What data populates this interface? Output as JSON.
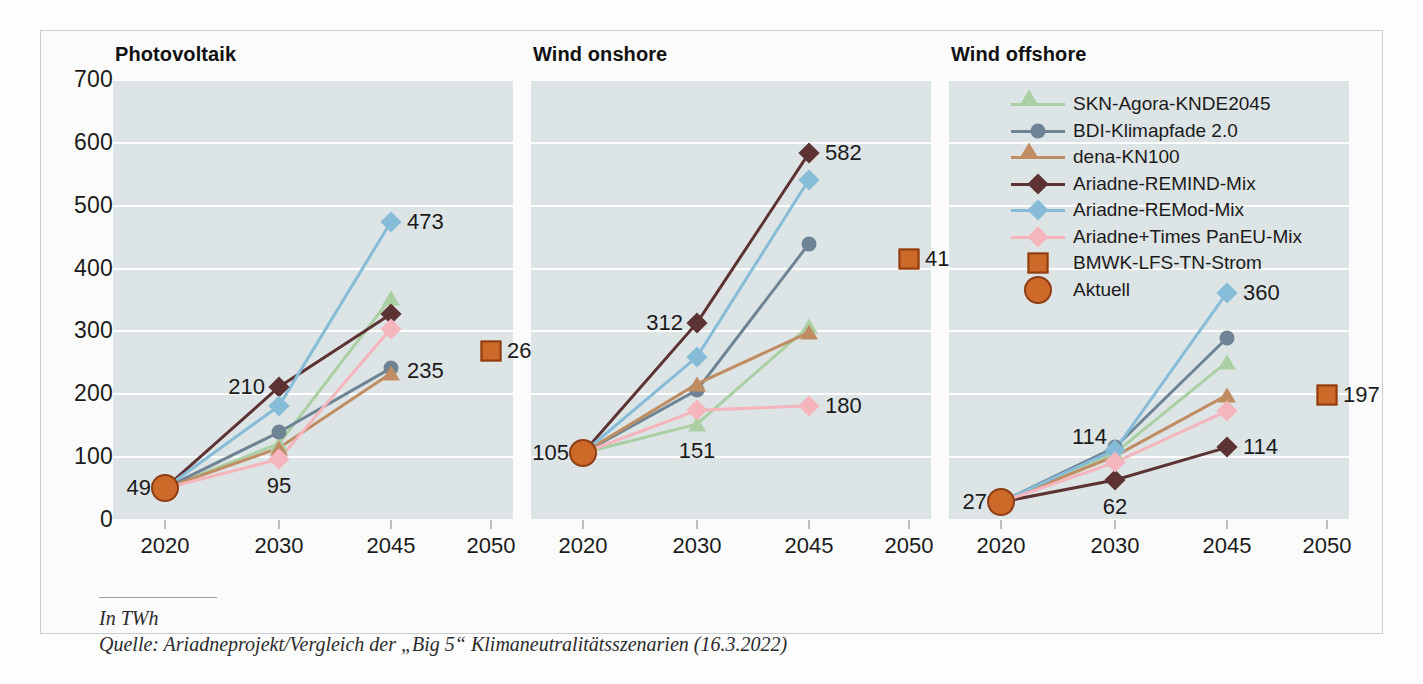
{
  "footer": {
    "unit": "In TWh",
    "source": "Quelle: Ariadneprojekt/Vergleich der „Big 5“ Klimaneutralitätsszenarien (16.3.2022)"
  },
  "legend": {
    "items": [
      {
        "label": "SKN-Agora-KNDE2045",
        "color": "#a9cfa3",
        "marker": "triangle",
        "line": true
      },
      {
        "label": "BDI-Klimapfade 2.0",
        "color": "#6e8494",
        "marker": "circle",
        "line": true
      },
      {
        "label": "dena-KN100",
        "color": "#c08d63",
        "marker": "triangle",
        "line": true
      },
      {
        "label": "Ariadne-REMIND-Mix",
        "color": "#5c3233",
        "marker": "diamond",
        "line": true
      },
      {
        "label": "Ariadne-REMod-Mix",
        "color": "#86bcd8",
        "marker": "diamond",
        "line": true
      },
      {
        "label": "Ariadne+Times PanEU-Mix",
        "color": "#f5b5bd",
        "marker": "diamond",
        "line": true
      },
      {
        "label": "BMWK-LFS-TN-Strom",
        "color": "#cd6a2a",
        "marker": "square",
        "line": false
      },
      {
        "label": "Aktuell",
        "color": "#cd6a2a",
        "marker": "bigcircle",
        "line": false
      }
    ]
  },
  "chart_data": [
    {
      "type": "line",
      "title": "Photovoltaik",
      "xlabel": "",
      "ylabel": "In TWh",
      "x": [
        2020,
        2030,
        2045,
        2050
      ],
      "xtick_labels": [
        "2020",
        "2030",
        "2045",
        "2050"
      ],
      "ylim": [
        0,
        700
      ],
      "yticks": [
        0,
        100,
        200,
        300,
        400,
        500,
        600,
        700
      ],
      "grid": true,
      "legend_position": "right",
      "series": [
        {
          "name": "SKN-Agora-KNDE2045",
          "x": [
            2020,
            2030,
            2045
          ],
          "values": [
            49,
            120,
            352
          ]
        },
        {
          "name": "BDI-Klimapfade 2.0",
          "x": [
            2020,
            2030,
            2045
          ],
          "values": [
            49,
            138,
            240
          ]
        },
        {
          "name": "dena-KN100",
          "x": [
            2020,
            2030,
            2045
          ],
          "values": [
            49,
            113,
            232
          ]
        },
        {
          "name": "Ariadne-REMIND-Mix",
          "x": [
            2020,
            2030,
            2045
          ],
          "values": [
            49,
            210,
            326
          ]
        },
        {
          "name": "Ariadne-REMod-Mix",
          "x": [
            2020,
            2030,
            2045
          ],
          "values": [
            49,
            180,
            473
          ]
        },
        {
          "name": "Ariadne+Times PanEU-Mix",
          "x": [
            2020,
            2030,
            2045
          ],
          "values": [
            49,
            95,
            303
          ]
        },
        {
          "name": "BMWK-LFS-TN-Strom",
          "x": [
            2050
          ],
          "values": [
            268
          ]
        },
        {
          "name": "Aktuell",
          "x": [
            2020
          ],
          "values": [
            49
          ]
        }
      ],
      "annotations": [
        {
          "text": "49",
          "x": 2020,
          "y": 49,
          "place": "left"
        },
        {
          "text": "210",
          "x": 2030,
          "y": 210,
          "place": "left"
        },
        {
          "text": "95",
          "x": 2030,
          "y": 95,
          "place": "below"
        },
        {
          "text": "473",
          "x": 2045,
          "y": 473,
          "place": "right"
        },
        {
          "text": "235",
          "x": 2045,
          "y": 236,
          "place": "right"
        },
        {
          "text": "268",
          "x": 2050,
          "y": 268,
          "place": "right"
        }
      ]
    },
    {
      "type": "line",
      "title": "Wind onshore",
      "xlabel": "",
      "ylabel": "In TWh",
      "x": [
        2020,
        2030,
        2045,
        2050
      ],
      "xtick_labels": [
        "2020",
        "2030",
        "2045",
        "2050"
      ],
      "ylim": [
        0,
        700
      ],
      "yticks": [
        0,
        100,
        200,
        300,
        400,
        500,
        600,
        700
      ],
      "grid": true,
      "legend_position": "right",
      "series": [
        {
          "name": "SKN-Agora-KNDE2045",
          "x": [
            2020,
            2030,
            2045
          ],
          "values": [
            105,
            151,
            307
          ]
        },
        {
          "name": "BDI-Klimapfade 2.0",
          "x": [
            2020,
            2030,
            2045
          ],
          "values": [
            105,
            205,
            438
          ]
        },
        {
          "name": "dena-KN100",
          "x": [
            2020,
            2030,
            2045
          ],
          "values": [
            105,
            215,
            297
          ]
        },
        {
          "name": "Ariadne-REMIND-Mix",
          "x": [
            2020,
            2030,
            2045
          ],
          "values": [
            105,
            312,
            582
          ]
        },
        {
          "name": "Ariadne-REMod-Mix",
          "x": [
            2020,
            2030,
            2045
          ],
          "values": [
            105,
            258,
            540
          ]
        },
        {
          "name": "Ariadne+Times PanEU-Mix",
          "x": [
            2020,
            2030,
            2045
          ],
          "values": [
            105,
            173,
            180
          ]
        },
        {
          "name": "BMWK-LFS-TN-Strom",
          "x": [
            2050
          ],
          "values": [
            413
          ]
        },
        {
          "name": "Aktuell",
          "x": [
            2020
          ],
          "values": [
            105
          ]
        }
      ],
      "annotations": [
        {
          "text": "105",
          "x": 2020,
          "y": 105,
          "place": "left"
        },
        {
          "text": "312",
          "x": 2030,
          "y": 312,
          "place": "left"
        },
        {
          "text": "151",
          "x": 2030,
          "y": 151,
          "place": "below"
        },
        {
          "text": "582",
          "x": 2045,
          "y": 582,
          "place": "right"
        },
        {
          "text": "180",
          "x": 2045,
          "y": 180,
          "place": "right"
        },
        {
          "text": "413",
          "x": 2050,
          "y": 413,
          "place": "right"
        }
      ]
    },
    {
      "type": "line",
      "title": "Wind offshore",
      "xlabel": "",
      "ylabel": "In TWh",
      "x": [
        2020,
        2030,
        2045,
        2050
      ],
      "xtick_labels": [
        "2020",
        "2030",
        "2045",
        "2050"
      ],
      "ylim": [
        0,
        700
      ],
      "yticks": [
        0,
        100,
        200,
        300,
        400,
        500,
        600,
        700
      ],
      "grid": true,
      "legend_position": "right",
      "series": [
        {
          "name": "SKN-Agora-KNDE2045",
          "x": [
            2020,
            2030,
            2045
          ],
          "values": [
            27,
            105,
            250
          ]
        },
        {
          "name": "BDI-Klimapfade 2.0",
          "x": [
            2020,
            2030,
            2045
          ],
          "values": [
            27,
            114,
            288
          ]
        },
        {
          "name": "dena-KN100",
          "x": [
            2020,
            2030,
            2045
          ],
          "values": [
            27,
            100,
            197
          ]
        },
        {
          "name": "Ariadne-REMIND-Mix",
          "x": [
            2020,
            2030,
            2045
          ],
          "values": [
            27,
            62,
            114
          ]
        },
        {
          "name": "Ariadne-REMod-Mix",
          "x": [
            2020,
            2030,
            2045
          ],
          "values": [
            27,
            110,
            360
          ]
        },
        {
          "name": "Ariadne+Times PanEU-Mix",
          "x": [
            2020,
            2030,
            2045
          ],
          "values": [
            27,
            90,
            172
          ]
        },
        {
          "name": "BMWK-LFS-TN-Strom",
          "x": [
            2050
          ],
          "values": [
            197
          ]
        },
        {
          "name": "Aktuell",
          "x": [
            2020
          ],
          "values": [
            27
          ]
        }
      ],
      "annotations": [
        {
          "text": "27",
          "x": 2020,
          "y": 27,
          "place": "left"
        },
        {
          "text": "114",
          "x": 2030,
          "y": 130,
          "place": "leftnear"
        },
        {
          "text": "62",
          "x": 2030,
          "y": 62,
          "place": "below"
        },
        {
          "text": "360",
          "x": 2045,
          "y": 360,
          "place": "right"
        },
        {
          "text": "114",
          "x": 2045,
          "y": 114,
          "place": "right"
        },
        {
          "text": "197",
          "x": 2050,
          "y": 197,
          "place": "right"
        }
      ]
    }
  ]
}
